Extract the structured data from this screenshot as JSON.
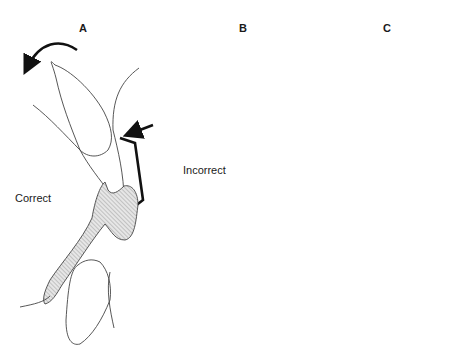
{
  "figure": {
    "panels": [
      {
        "id": "A",
        "label": "A",
        "caption": "Correct"
      },
      {
        "id": "B",
        "label": "B",
        "caption": "Incorrect"
      },
      {
        "id": "C",
        "label": "C",
        "caption": ""
      }
    ],
    "colors": {
      "outline": "#333333",
      "wire": "#111111",
      "hatch_fill": "#dcdcdc",
      "background": "#ffffff"
    }
  }
}
